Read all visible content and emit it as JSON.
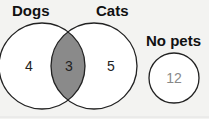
{
  "diagram": {
    "type": "venn",
    "sets": [
      {
        "label": "Dogs",
        "only": "4"
      },
      {
        "label": "Cats",
        "only": "5"
      }
    ],
    "intersection": "3",
    "outside": {
      "label": "No pets",
      "value": "12"
    },
    "colors": {
      "intersection": "#8a8a8a",
      "stroke": "#222222",
      "background": "#f3f3f1"
    }
  }
}
